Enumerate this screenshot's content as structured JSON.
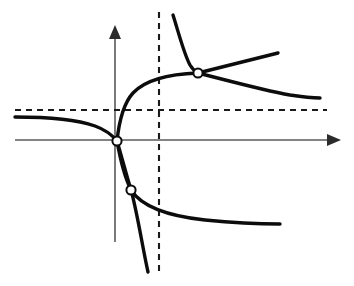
{
  "figure": {
    "width": 354,
    "height": 286,
    "background_color": "#ffffff"
  },
  "chart_data": {
    "type": "line",
    "title": "",
    "subtitle": "",
    "xlabel": "",
    "ylabel": "",
    "grid": false,
    "legend": "none",
    "axis_style": "arrowed-cartesian",
    "tick_labels": {
      "x": [],
      "y": []
    },
    "xlim": [
      0,
      354
    ],
    "ylim": [
      286,
      0
    ],
    "origin_px": {
      "x": 117,
      "y": 140
    },
    "axes": {
      "x_axis": {
        "name": "x-axis",
        "y_px": 140,
        "x_start_px": 15,
        "x_end_px": 341,
        "arrow": "right",
        "color": "#5a5a5a"
      },
      "y_axis": {
        "name": "y-axis",
        "x_px": 115,
        "y_start_px": 242,
        "y_end_px": 25,
        "arrow": "up",
        "color": "#5a5a5a"
      }
    },
    "asymptotes": [
      {
        "name": "horizontal-asymptote",
        "orientation": "horizontal",
        "y_px": 110,
        "x_start_px": 15,
        "x_end_px": 327,
        "style": "dashed",
        "color": "#1a1a1a"
      },
      {
        "name": "vertical-asymptote",
        "orientation": "vertical",
        "x_px": 159,
        "y_start_px": 12,
        "y_end_px": 276,
        "style": "dashed",
        "color": "#1a1a1a"
      }
    ],
    "series": [
      {
        "name": "left-branch-upper",
        "description": "Flat branch entering from the left just below the horizontal asymptote, descending into the origin",
        "color": "#0c0c0c",
        "path": "M 15,117 C 45,117 75,119 95,126 C 106,130 113,136 117,141"
      },
      {
        "name": "rising-branch-to-vertical-asymptote",
        "description": "Branch rising steeply from the origin and flattening as it approaches the upper intersection",
        "color": "#0c0c0c",
        "path": "M 117,141 C 119,122 123,104 133,93 C 146,79 170,74 198,73"
      },
      {
        "name": "upper-steep-descending-branch",
        "description": "Steeply descending branch from the top, crossing the vertical asymptote into the intersection",
        "color": "#0c0c0c",
        "path": "M 173,15 C 179,34 184,54 190,65 C 193,70 196,72 198,73"
      },
      {
        "name": "upper-rising-line",
        "description": "Nearly straight rising segment leaving the upper intersection toward the upper right",
        "color": "#0c0c0c",
        "path": "M 198,73 L 278,53"
      },
      {
        "name": "upper-right-decaying-branch",
        "description": "Slowly decaying branch from the upper intersection toward the right, approaching the horizontal asymptote",
        "color": "#0c0c0c",
        "path": "M 198,73 C 226,80 262,90 290,95 C 303,97 313,98 320,98"
      },
      {
        "name": "lower-steep-line",
        "description": "Steep descending line from the origin through the lower marker to the bottom",
        "color": "#0c0c0c",
        "path": "M 117,141 C 122,158 127,177 131,190 C 137,211 143,250 148,272"
      },
      {
        "name": "lower-right-decaying-branch",
        "description": "Curve bowing out of the origin through the lower marker and flattening toward the right",
        "color": "#0c0c0c",
        "path": "M 117,141 C 120,158 125,178 131,190 C 142,207 167,216 205,220 C 235,223 262,224 280,224"
      }
    ],
    "markers": [
      {
        "name": "origin-marker",
        "x_px": 117,
        "y_px": 141,
        "radius_px": 4.6,
        "style": "open-circle"
      },
      {
        "name": "upper-intersection-marker",
        "x_px": 198,
        "y_px": 73,
        "radius_px": 4.6,
        "style": "open-circle"
      },
      {
        "name": "lower-intersection-marker",
        "x_px": 131,
        "y_px": 190,
        "radius_px": 4.6,
        "style": "open-circle"
      }
    ]
  }
}
